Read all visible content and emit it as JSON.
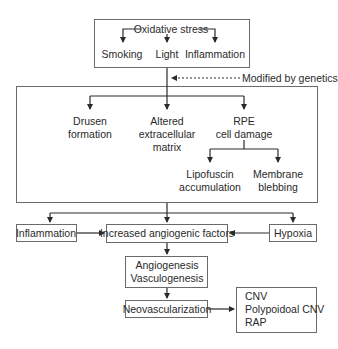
{
  "diagram": {
    "top_box": {
      "title": "Oxidative stress",
      "children": [
        "Smoking",
        "Light",
        "Inflammation"
      ]
    },
    "modifier_note": "Modified by genetics",
    "middle_box": {
      "branches": [
        {
          "line1": "Drusen",
          "line2": "formation"
        },
        {
          "line1": "Altered",
          "line2": "extracellular",
          "line3": "matrix"
        },
        {
          "line1": "RPE",
          "line2": "cell damage"
        }
      ],
      "rpe_children": [
        {
          "line1": "Lipofuscin",
          "line2": "accumulation"
        },
        {
          "line1": "Membrane",
          "line2": "blebbing"
        }
      ]
    },
    "factors_row": {
      "left": "Inflammation",
      "center": "Increased angiogenic factors",
      "right": "Hypoxia"
    },
    "angio_box": {
      "line1": "Angiogenesis",
      "line2": "Vasculogenesis"
    },
    "neovasc_box": "Neovascularization",
    "outcome_box": {
      "line1": "CNV",
      "line2": "Polypoidoal CNV",
      "line3": "RAP"
    },
    "colors": {
      "line": "#2a2a2a",
      "box_border": "#6a6a6a",
      "text": "#2a2a2a",
      "background": "#ffffff"
    }
  }
}
